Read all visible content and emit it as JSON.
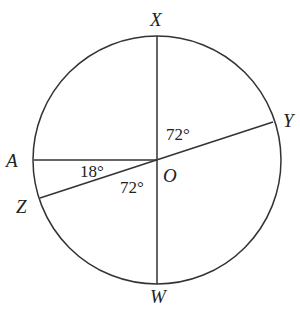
{
  "diagram": {
    "type": "circle-geometry",
    "center_label": "O",
    "points": {
      "X": "X",
      "Y": "Y",
      "A": "A",
      "Z": "Z",
      "W": "W",
      "O": "O"
    },
    "segments": [
      "XW",
      "YZ",
      "AO"
    ],
    "angles": {
      "XOY": "72°",
      "AOZ": "18°",
      "ZOW": "72°"
    }
  }
}
